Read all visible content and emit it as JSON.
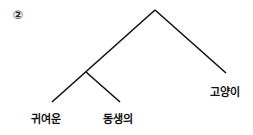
{
  "diagram": {
    "number_label": "②",
    "type": "syntax-tree",
    "line_color": "#111111",
    "nodes": {
      "root": {
        "x": 155,
        "y": 10
      },
      "inner": {
        "x": 86,
        "y": 72
      }
    },
    "leaves": [
      {
        "id": "leaf-1",
        "label": "귀여운",
        "line_end": {
          "x": 52,
          "y": 102
        },
        "label_pos": {
          "x": 31,
          "y": 110
        }
      },
      {
        "id": "leaf-2",
        "label": "동생의",
        "line_end": {
          "x": 120,
          "y": 102
        },
        "label_pos": {
          "x": 103,
          "y": 110
        }
      },
      {
        "id": "leaf-3",
        "label": "고양이",
        "line_end": {
          "x": 226,
          "y": 73
        },
        "label_pos": {
          "x": 210,
          "y": 83
        }
      }
    ]
  }
}
